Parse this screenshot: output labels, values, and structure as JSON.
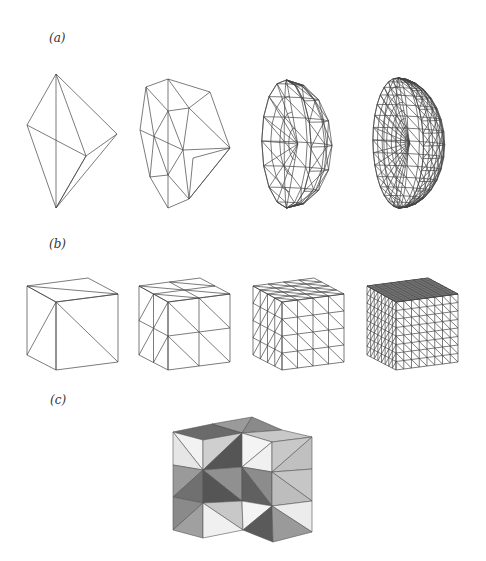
{
  "labels": {
    "a": "(a)",
    "b": "(b)",
    "c": "(c)"
  },
  "colors": {
    "line": "#444444",
    "white": "#f4f4f4",
    "light": "#c8c8c8",
    "mid": "#9a9a9a",
    "dark": "#6a6a6a"
  },
  "panel_a": {
    "description": "Successive refinements of a tetrahedral mesh approximating a half-sphere",
    "meshes": [
      {
        "name": "level-0",
        "outline": [
          [
            56,
            74
          ],
          [
            117,
            134
          ],
          [
            86,
            156
          ],
          [
            56,
            208
          ],
          [
            27,
            125
          ]
        ]
      },
      {
        "name": "level-1",
        "outline": [
          [
            168,
            79
          ],
          [
            146,
            87
          ],
          [
            140,
            130
          ],
          [
            150,
            177
          ],
          [
            168,
            208
          ],
          [
            189,
            199
          ],
          [
            230,
            148
          ],
          [
            210,
            92
          ]
        ]
      },
      {
        "name": "level-2",
        "outline": [
          [
            271,
            80
          ],
          [
            305,
            83
          ],
          [
            335,
            113
          ],
          [
            345,
            148
          ],
          [
            335,
            185
          ],
          [
            300,
            205
          ],
          [
            280,
            208
          ],
          [
            262,
            180
          ],
          [
            254,
            140
          ],
          [
            258,
            100
          ]
        ]
      },
      {
        "name": "level-3",
        "outline": [
          [
            395,
            78
          ],
          [
            420,
            80
          ],
          [
            445,
            102
          ],
          [
            458,
            140
          ],
          [
            452,
            180
          ],
          [
            425,
            205
          ],
          [
            405,
            208
          ],
          [
            378,
            180
          ],
          [
            368,
            140
          ],
          [
            372,
            100
          ]
        ]
      }
    ]
  },
  "panel_b": {
    "description": "Successive uniform refinements of a tetrahedral mesh of a cube",
    "cubes": [
      {
        "name": "level-0",
        "divisions": 1
      },
      {
        "name": "level-1",
        "divisions": 2
      },
      {
        "name": "level-2",
        "divisions": 4
      },
      {
        "name": "level-3",
        "divisions": 8
      }
    ]
  },
  "panel_c": {
    "description": "Shaded L-shaped block of tetrahedra (2x2x3 minus one column) with alternating gray levels"
  }
}
